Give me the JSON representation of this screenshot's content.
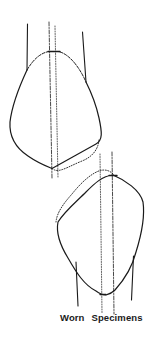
{
  "figure": {
    "caption": {
      "word1": "Worn",
      "word2": "Specimens"
    },
    "colors": {
      "ink": "#1a1a1a",
      "background": "#ffffff"
    },
    "elements": {
      "top_tooth": {
        "crown_outline": "solid",
        "worn_outline": "dotted",
        "center_axis": "dash-dot",
        "secondary_axis": "dotted",
        "roots": 2
      },
      "bottom_tooth": {
        "crown_outline": "solid",
        "worn_outline": "dotted",
        "center_axis": "dash-dot",
        "secondary_axis": "dotted",
        "roots": 2
      }
    }
  }
}
